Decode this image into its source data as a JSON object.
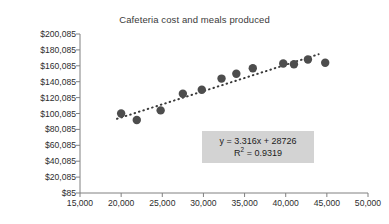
{
  "chart_data": {
    "type": "scatter",
    "title": "Cafeteria cost and meals produced",
    "xlabel": "",
    "ylabel": "",
    "xlim": [
      15000,
      50000
    ],
    "ylim": [
      85,
      200085
    ],
    "grid": false,
    "legend": "none",
    "x_ticks": [
      "15,000",
      "20,000",
      "25,000",
      "30,000",
      "35,000",
      "40,000",
      "45,000",
      "50,000"
    ],
    "x_tick_values": [
      15000,
      20000,
      25000,
      30000,
      35000,
      40000,
      45000,
      50000
    ],
    "y_ticks": [
      "$85",
      "$20,085",
      "$40,085",
      "$60,085",
      "$80,085",
      "$100,085",
      "$120,085",
      "$140,085",
      "$160,085",
      "$180,085",
      "$200,085"
    ],
    "y_tick_values": [
      85,
      20085,
      40085,
      60085,
      80085,
      100085,
      120085,
      140085,
      160085,
      180085,
      200085
    ],
    "series": [
      {
        "name": "Cafeteria cost",
        "marker": "circle",
        "color": "#4d4d4d",
        "x": [
          20000,
          21900,
          24800,
          27500,
          29800,
          32200,
          34000,
          36000,
          39700,
          41000,
          42700,
          44800
        ],
        "y": [
          100000,
          92000,
          104000,
          125000,
          130000,
          144000,
          150000,
          157000,
          163000,
          162000,
          168000,
          164000
        ]
      }
    ],
    "trendline": {
      "type": "linear",
      "style": "dotted",
      "color": "#3a3a3a",
      "slope": 3.316,
      "intercept": 28726,
      "r_squared": 0.9319,
      "equation_text": "y = 3.316x + 28726",
      "r2_prefix": "R",
      "r2_exponent": "2",
      "r2_text": " = 0.9319",
      "x_start": 19500,
      "x_end": 44000
    }
  },
  "axes": {
    "line_color": "#808080",
    "tick_color": "#808080"
  }
}
